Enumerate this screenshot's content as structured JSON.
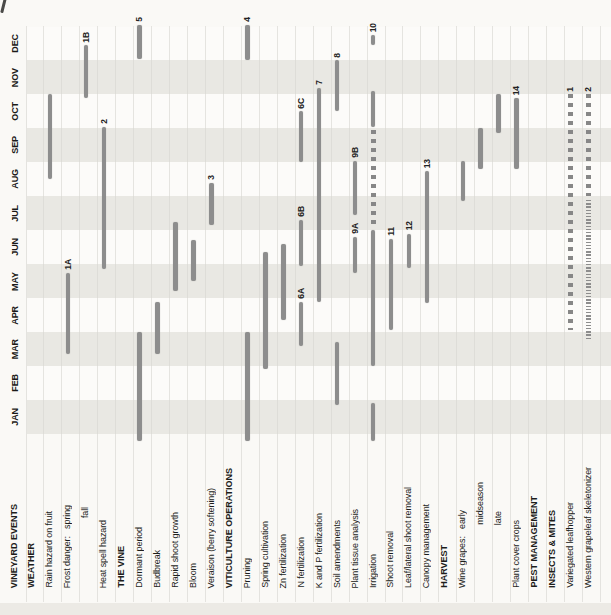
{
  "chart_data": {
    "type": "bar",
    "subtype": "gantt-timeline-rotated-90ccw",
    "title": "",
    "time_axis": {
      "unit": "month",
      "range": [
        0,
        12
      ],
      "labels": [
        "JAN",
        "FEB",
        "MAR",
        "APR",
        "MAY",
        "JUN",
        "JUL",
        "AUG",
        "SEP",
        "OCT",
        "NOV",
        "DEC"
      ],
      "direction": "bottom-to-top",
      "position": "left",
      "shaded_months": [
        "JAN",
        "MAR",
        "MAY",
        "JUL",
        "SEP",
        "NOV"
      ],
      "grid": "per-category-gridlines"
    },
    "legend_position": "none",
    "rows": [
      {
        "label": "VINEYARD EVENTS",
        "style": "header",
        "bars": []
      },
      {
        "label": "WEATHER",
        "style": "header",
        "bars": []
      },
      {
        "label": "Rain hazard on fruit",
        "style": "item",
        "bars": [
          {
            "start": 7.5,
            "end": 10.0,
            "pattern": "solid",
            "marker": ""
          }
        ]
      },
      {
        "label": "Frost danger:   spring",
        "style": "item",
        "bars": [
          {
            "start": 2.35,
            "end": 4.75,
            "pattern": "solid",
            "marker": "1A"
          }
        ]
      },
      {
        "label": "fall",
        "style": "subitem",
        "rise": 70,
        "bars": [
          {
            "start": 9.9,
            "end": 11.45,
            "pattern": "solid",
            "marker": "1B"
          }
        ]
      },
      {
        "label": "Heat spell hazard",
        "style": "item",
        "bars": [
          {
            "start": 4.85,
            "end": 9.05,
            "pattern": "solid",
            "marker": "2"
          }
        ]
      },
      {
        "label": "THE VINE",
        "style": "header",
        "bars": []
      },
      {
        "label": "Dormant period",
        "style": "item",
        "bars": [
          {
            "start": -0.2,
            "end": 3.0,
            "pattern": "solid",
            "marker": ""
          },
          {
            "start": 11.05,
            "end": 12.05,
            "pattern": "solid",
            "marker": "5"
          }
        ]
      },
      {
        "label": "Budbreak",
        "style": "item",
        "bars": [
          {
            "start": 2.35,
            "end": 3.9,
            "pattern": "solid",
            "marker": ""
          }
        ]
      },
      {
        "label": "Rapid shoot growth",
        "style": "item",
        "bars": [
          {
            "start": 4.2,
            "end": 6.25,
            "pattern": "solid",
            "marker": ""
          }
        ]
      },
      {
        "label": "Bloom",
        "style": "item",
        "bars": [
          {
            "start": 4.5,
            "end": 5.7,
            "pattern": "solid",
            "marker": ""
          }
        ]
      },
      {
        "label": "Veraison (berry softening)",
        "style": "item",
        "bars": [
          {
            "start": 6.15,
            "end": 7.4,
            "pattern": "solid",
            "marker": "3"
          }
        ]
      },
      {
        "label": "VITICULTURE OPERATIONS",
        "style": "header",
        "bars": []
      },
      {
        "label": "Pruning",
        "style": "item",
        "bars": [
          {
            "start": -0.2,
            "end": 3.0,
            "pattern": "solid",
            "marker": ""
          },
          {
            "start": 11.0,
            "end": 12.05,
            "pattern": "solid",
            "marker": "4"
          }
        ]
      },
      {
        "label": "Spring cultivation",
        "style": "item",
        "bars": [
          {
            "start": 1.9,
            "end": 5.35,
            "pattern": "solid",
            "marker": ""
          }
        ]
      },
      {
        "label": "Zn fertilization",
        "style": "item",
        "bars": [
          {
            "start": 3.35,
            "end": 5.6,
            "pattern": "solid",
            "marker": ""
          }
        ]
      },
      {
        "label": "N fertilization",
        "style": "item",
        "bars": [
          {
            "start": 2.6,
            "end": 3.9,
            "pattern": "solid",
            "marker": "6A"
          },
          {
            "start": 4.95,
            "end": 6.3,
            "pattern": "solid",
            "marker": "6B"
          },
          {
            "start": 8.0,
            "end": 9.5,
            "pattern": "solid",
            "marker": "6C"
          }
        ]
      },
      {
        "label": "K and P fertilization",
        "style": "item",
        "bars": [
          {
            "start": 3.9,
            "end": 10.2,
            "pattern": "solid",
            "marker": "7"
          }
        ]
      },
      {
        "label": "Soil amendments",
        "style": "item",
        "bars": [
          {
            "start": 0.85,
            "end": 2.7,
            "pattern": "solid",
            "marker": ""
          },
          {
            "start": 9.5,
            "end": 11.0,
            "pattern": "solid",
            "marker": "8"
          }
        ]
      },
      {
        "label": "Plant tissue analysis",
        "style": "item",
        "bars": [
          {
            "start": 4.75,
            "end": 5.8,
            "pattern": "solid",
            "marker": "9A"
          },
          {
            "start": 6.45,
            "end": 8.05,
            "pattern": "solid",
            "marker": "9B"
          }
        ]
      },
      {
        "label": "Irrigation",
        "style": "item",
        "bars": [
          {
            "start": -0.2,
            "end": 0.9,
            "pattern": "solid",
            "marker": ""
          },
          {
            "start": 2.0,
            "end": 6.0,
            "pattern": "solid",
            "marker": ""
          },
          {
            "start": 6.1,
            "end": 8.95,
            "pattern": "dashed",
            "marker": ""
          },
          {
            "start": 9.05,
            "end": 10.1,
            "pattern": "solid",
            "marker": ""
          },
          {
            "start": 11.45,
            "end": 11.75,
            "pattern": "solid",
            "marker": "10"
          }
        ]
      },
      {
        "label": "Shoot removal",
        "style": "item",
        "bars": [
          {
            "start": 3.05,
            "end": 5.75,
            "pattern": "solid",
            "marker": "11"
          }
        ]
      },
      {
        "label": "Leaf/lateral shoot removal",
        "style": "item",
        "bars": [
          {
            "start": 4.9,
            "end": 5.9,
            "pattern": "solid",
            "marker": "12"
          }
        ]
      },
      {
        "label": "Canopy management",
        "style": "item",
        "bars": [
          {
            "start": 3.85,
            "end": 7.75,
            "pattern": "solid",
            "marker": "13"
          }
        ]
      },
      {
        "label": "HARVEST",
        "style": "header",
        "bars": []
      },
      {
        "label": "Wine grapes:   early",
        "style": "item",
        "bars": [
          {
            "start": 6.85,
            "end": 8.05,
            "pattern": "solid",
            "marker": ""
          }
        ]
      },
      {
        "label": "midseason",
        "style": "subitem",
        "rise": 63,
        "bars": [
          {
            "start": 7.8,
            "end": 9.0,
            "pattern": "solid",
            "marker": ""
          }
        ]
      },
      {
        "label": "late",
        "style": "subitem",
        "rise": 63,
        "bars": [
          {
            "start": 8.85,
            "end": 10.0,
            "pattern": "solid",
            "marker": ""
          }
        ]
      },
      {
        "label": "Plant cover crops",
        "style": "item",
        "bars": [
          {
            "start": 7.8,
            "end": 9.9,
            "pattern": "solid",
            "marker": "14"
          }
        ]
      },
      {
        "label": "PEST MANAGEMENT",
        "style": "header",
        "bars": []
      },
      {
        "label": "INSECTS & MITES",
        "style": "header",
        "bars": []
      },
      {
        "label": "Variegated leafhopper",
        "style": "item",
        "bars": [
          {
            "start": 3.05,
            "end": 10.0,
            "pattern": "dashed",
            "marker": "1"
          }
        ]
      },
      {
        "label": "Western grapeleaf skeletonizer",
        "style": "item",
        "bars": [
          {
            "start": 2.75,
            "end": 6.9,
            "pattern": "dotted",
            "marker": ""
          },
          {
            "start": 7.0,
            "end": 10.0,
            "pattern": "dashed",
            "marker": "2"
          }
        ]
      }
    ],
    "colors": {
      "bar": "#8d8d8d",
      "band_shaded": "#e9e8e3",
      "band_plain": "#fcfbf9",
      "gridline": "#d9d7d2",
      "text": "#1d1d1b",
      "background": "#faf9f6"
    }
  }
}
